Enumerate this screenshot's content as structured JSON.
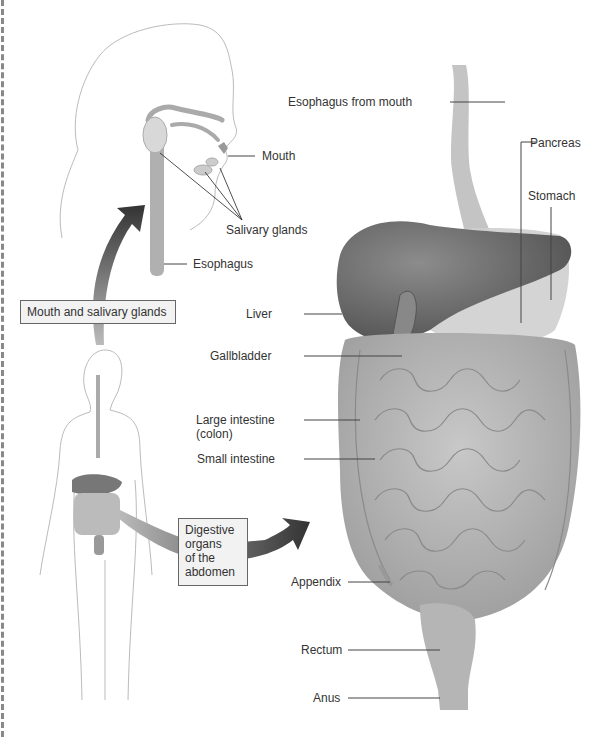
{
  "figure": {
    "type": "anatomical-diagram"
  },
  "callout_boxes": {
    "mouth": "Mouth and salivary glands",
    "digestive_l1": "Digestive",
    "digestive_l2": "organs",
    "digestive_l3": "of the",
    "digestive_l4": "abdomen"
  },
  "head_labels": {
    "mouth": "Mouth",
    "salivary": "Salivary glands",
    "esophagus": "Esophagus"
  },
  "organ_labels": {
    "esophagus_from_mouth": "Esophagus from mouth",
    "pancreas": "Pancreas",
    "stomach": "Stomach",
    "liver": "Liver",
    "gallbladder": "Gallbladder",
    "large_intestine_l1": "Large intestine",
    "large_intestine_l2": "(colon)",
    "small_intestine": "Small intestine",
    "appendix": "Appendix",
    "rectum": "Rectum",
    "anus": "Anus"
  },
  "colors": {
    "organ_dark": "#6e6e6e",
    "organ_mid": "#9a9a9a",
    "organ_light": "#c4c4c4",
    "arrow": "#3a3a3a",
    "leader_line": "#444444"
  }
}
